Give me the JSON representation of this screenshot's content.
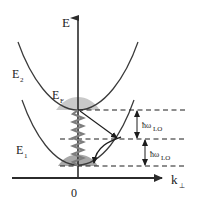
{
  "figure": {
    "background_color": "#ffffff",
    "ink_color": "#2b2b2b"
  },
  "axes": {
    "vertical": {
      "name": "energy-axis",
      "label": "E",
      "label_x": 62,
      "label_y": 27,
      "x": 78,
      "y_top": 14,
      "y_bottom": 178,
      "arrow": "up"
    },
    "horizontal": {
      "name": "k-perp-axis",
      "label_main": "k",
      "label_sub": "⊥",
      "label_x": 173,
      "label_y": 183,
      "y": 178,
      "x_left": 12,
      "x_right": 168,
      "arrow": "right"
    },
    "origin": {
      "label": "0",
      "x": 74,
      "y": 196
    }
  },
  "bands": [
    {
      "name": "subband-E2",
      "label_main": "E",
      "label_sub": "2",
      "label_x": 14,
      "label_y": 76,
      "vertex_x": 78,
      "vertex_y": 110,
      "curvature": 0.0165,
      "color": "#3a3a3a"
    },
    {
      "name": "subband-E1",
      "label_main": "E",
      "label_sub": "1",
      "label_x": 18,
      "label_y": 152,
      "vertex_x": 78,
      "vertex_y": 165,
      "curvature": 0.0165,
      "color": "#3a3a3a"
    }
  ],
  "fermi": {
    "name": "fermi-level",
    "label_main": "E",
    "label_sub": "F",
    "label_x": 54,
    "label_y": 97,
    "level_y": 110,
    "fill_color": "#c9c9c9"
  },
  "occupied_region_lower": {
    "name": "occupied-states-E1",
    "fill_color": "#8f8f8f",
    "top_y": 157,
    "bottom_y": 168
  },
  "phonon_wave": {
    "name": "phonon-wavy-line",
    "x": 78,
    "y_top": 110,
    "y_bottom": 166,
    "amplitude": 5,
    "periods": 7,
    "color": "#7d7d7d"
  },
  "transitions": [
    {
      "name": "intersubband-scattering-arrow",
      "type": "straight",
      "from_x": 80,
      "from_y": 111,
      "to_x": 118,
      "to_y": 139
    },
    {
      "name": "intrasubband-relaxation-arrow",
      "type": "curved",
      "from_x": 121,
      "from_y": 137,
      "to_x": 94,
      "to_y": 165
    }
  ],
  "dashed_levels": [
    {
      "name": "dashed-level-fermi",
      "y": 110,
      "x_start": 76,
      "x_end": 186
    },
    {
      "name": "dashed-level-mid",
      "y": 139,
      "x_start": 60,
      "x_end": 186
    },
    {
      "name": "dashed-level-bottom",
      "y": 166,
      "x_start": 60,
      "x_end": 186
    }
  ],
  "phonon_energies": [
    {
      "name": "phonon-energy-upper",
      "label_hbar": "ħω",
      "label_sub": "LO",
      "label_x": 144,
      "label_y": 128,
      "arrow_x": 137,
      "arrow_top_y": 111,
      "arrow_bottom_y": 138
    },
    {
      "name": "phonon-energy-lower",
      "label_hbar": "ħω",
      "label_sub": "LO",
      "label_x": 152,
      "label_y": 157,
      "arrow_x": 145,
      "arrow_top_y": 140,
      "arrow_bottom_y": 165
    }
  ]
}
